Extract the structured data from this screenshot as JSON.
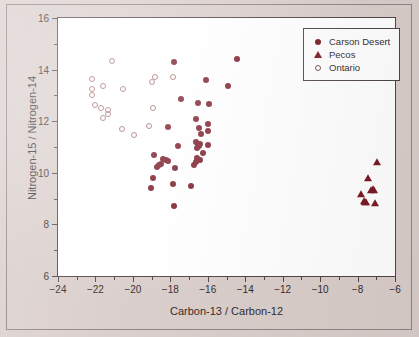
{
  "figure": {
    "background_color": "#d8ccc9",
    "plot_background_color": "#ffffff",
    "frame_color": "#4a3f3f"
  },
  "chart_data": {
    "type": "scatter",
    "title": "",
    "xlabel": "Carbon-13 / Carbon-12",
    "ylabel": "Nitrogen-15 / Nitrogen-14",
    "xlim": [
      -24,
      -6
    ],
    "ylim": [
      6,
      16
    ],
    "xticks": [
      -24,
      -22,
      -20,
      -18,
      -16,
      -14,
      -12,
      -10,
      -8,
      -6
    ],
    "xticklabels": [
      "−24",
      "−22",
      "−20",
      "−18",
      "−16",
      "−14",
      "−12",
      "−10",
      "−8",
      "−6"
    ],
    "x_minor_ticks": [
      -23,
      -21,
      -19,
      -17,
      -15,
      -13,
      -11,
      -9,
      -7
    ],
    "yticks": [
      6,
      8,
      10,
      12,
      14,
      16
    ],
    "yticklabels": [
      "6",
      "8",
      "10",
      "12",
      "14",
      "16"
    ],
    "y_minor_ticks": [
      7,
      9,
      11,
      13,
      15
    ],
    "grid": false,
    "legend_position": "upper right",
    "series": [
      {
        "name": "Carson Desert",
        "marker": "filled-circle",
        "color": "#741220",
        "points": [
          [
            -17.78,
            14.28
          ],
          [
            -14.45,
            14.42
          ],
          [
            -16.08,
            13.58
          ],
          [
            -14.92,
            13.38
          ],
          [
            -17.45,
            12.85
          ],
          [
            -16.5,
            12.72
          ],
          [
            -15.95,
            12.68
          ],
          [
            -16.62,
            12.1
          ],
          [
            -16.0,
            11.9
          ],
          [
            -18.12,
            11.78
          ],
          [
            -16.48,
            11.75
          ],
          [
            -16.35,
            11.5
          ],
          [
            -15.98,
            11.62
          ],
          [
            -17.6,
            11.05
          ],
          [
            -16.62,
            11.18
          ],
          [
            -16.52,
            11.1
          ],
          [
            -16.45,
            11.02
          ],
          [
            -16.58,
            10.95
          ],
          [
            -16.4,
            11.12
          ],
          [
            -15.98,
            11.08
          ],
          [
            -16.28,
            10.78
          ],
          [
            -16.55,
            10.58
          ],
          [
            -16.42,
            10.48
          ],
          [
            -16.62,
            10.4
          ],
          [
            -16.72,
            10.32
          ],
          [
            -18.88,
            10.68
          ],
          [
            -18.38,
            10.55
          ],
          [
            -18.25,
            10.5
          ],
          [
            -18.12,
            10.45
          ],
          [
            -18.48,
            10.35
          ],
          [
            -18.6,
            10.3
          ],
          [
            -17.75,
            10.18
          ],
          [
            -18.95,
            9.78
          ],
          [
            -17.88,
            9.58
          ],
          [
            -19.05,
            9.42
          ],
          [
            -16.9,
            9.48
          ],
          [
            -17.78,
            8.72
          ],
          [
            -18.7,
            10.22
          ]
        ]
      },
      {
        "name": "Pecos",
        "marker": "filled-triangle",
        "color": "#741220",
        "points": [
          [
            -6.98,
            10.42
          ],
          [
            -7.42,
            9.78
          ],
          [
            -7.18,
            9.38
          ],
          [
            -7.3,
            9.35
          ],
          [
            -7.1,
            9.32
          ],
          [
            -7.82,
            9.18
          ],
          [
            -7.68,
            8.92
          ],
          [
            -7.55,
            8.88
          ],
          [
            -7.62,
            8.85
          ],
          [
            -7.05,
            8.82
          ]
        ]
      },
      {
        "name": "Ontario",
        "marker": "open-circle",
        "color": "#9c6a68",
        "points": [
          [
            -21.12,
            14.32
          ],
          [
            -22.2,
            13.62
          ],
          [
            -18.82,
            13.7
          ],
          [
            -18.98,
            13.52
          ],
          [
            -17.85,
            13.72
          ],
          [
            -21.58,
            13.38
          ],
          [
            -20.52,
            13.25
          ],
          [
            -22.18,
            13.25
          ],
          [
            -22.18,
            13.02
          ],
          [
            -22.05,
            12.62
          ],
          [
            -21.72,
            12.52
          ],
          [
            -21.35,
            12.42
          ],
          [
            -21.32,
            12.28
          ],
          [
            -18.95,
            12.52
          ],
          [
            -21.58,
            12.12
          ],
          [
            -20.58,
            11.68
          ],
          [
            -19.12,
            11.82
          ],
          [
            -19.95,
            11.48
          ]
        ]
      }
    ]
  },
  "legend": {
    "items": [
      {
        "label": "Carson Desert",
        "symbol": "filled-circle-icon"
      },
      {
        "label": "Pecos",
        "symbol": "filled-triangle-icon"
      },
      {
        "label": "Ontario",
        "symbol": "open-circle-icon"
      }
    ]
  }
}
